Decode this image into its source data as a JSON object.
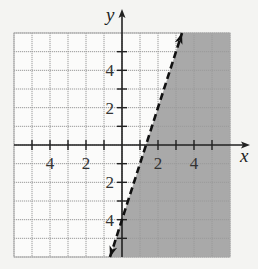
{
  "chart_data": {
    "type": "inequality-graph",
    "title": "",
    "xlabel": "x",
    "ylabel": "y",
    "xlim": [
      -6,
      6
    ],
    "ylim": [
      -6,
      6
    ],
    "grid": true,
    "grid_step": 1,
    "x_tick_labels": [
      {
        "value": -4,
        "label": "4"
      },
      {
        "value": -2,
        "label": "2"
      },
      {
        "value": 2,
        "label": "2"
      },
      {
        "value": 4,
        "label": "4"
      }
    ],
    "y_tick_labels": [
      {
        "value": 4,
        "label": "4"
      },
      {
        "value": 2,
        "label": "2"
      },
      {
        "value": -2,
        "label": "2"
      },
      {
        "value": -4,
        "label": "4"
      }
    ],
    "boundary_line": {
      "equation": "y = 3x - 4",
      "slope": 3,
      "intercept": -4,
      "style": "dashed",
      "points": [
        [
          -0.667,
          -6
        ],
        [
          3.333,
          6
        ]
      ]
    },
    "shaded_region": "right of line (y < 3x - 4)",
    "colors": {
      "shade": "#a9a9a9",
      "grid": "#9a9a9a",
      "axis": "#222222",
      "background": "#f4f4f2"
    }
  }
}
